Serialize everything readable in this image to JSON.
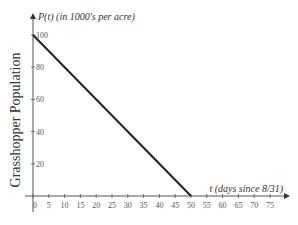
{
  "chart_data": {
    "type": "line",
    "title": "",
    "xlabel": "t (days since 8/31)",
    "ylabel": "Grasshopper Population",
    "y_axis_title": "P(t) (in 1000's per acre)",
    "x": [
      0,
      50
    ],
    "series": [
      {
        "name": "P(t)",
        "values": [
          100,
          0
        ]
      }
    ],
    "xlim": [
      0,
      80
    ],
    "ylim": [
      0,
      100
    ],
    "x_ticks": [
      0,
      5,
      10,
      15,
      20,
      25,
      30,
      35,
      40,
      45,
      50,
      55,
      60,
      65,
      70,
      75
    ],
    "y_ticks": [
      20,
      40,
      60,
      80,
      100
    ],
    "grid": false,
    "line_color": "#222222"
  }
}
